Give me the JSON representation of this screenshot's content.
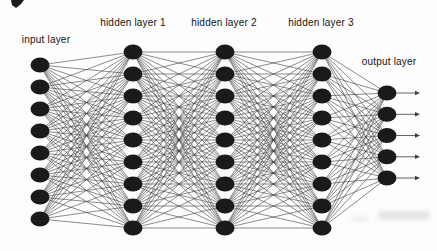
{
  "figure": {
    "background_color": "#fdfdfd",
    "node_color": "#1a1a1a",
    "edge_color": "#3c3c3c",
    "text_color": "#141414",
    "network": {
      "type": "fully-connected-feedforward",
      "node_rx": 9.5,
      "node_ry": 7.5,
      "arrow_end_x": 420,
      "layers": [
        {
          "name": "input",
          "label": "input layer",
          "num_nodes": 8,
          "x": 40,
          "y_start": 65,
          "y_end": 219,
          "label_cx": 46,
          "label_top": 34,
          "output_arrows": false
        },
        {
          "name": "hidden1",
          "label": "hidden layer 1",
          "num_nodes": 9,
          "x": 133,
          "y_start": 52,
          "y_end": 228,
          "label_cx": 133,
          "label_top": 17,
          "output_arrows": false
        },
        {
          "name": "hidden2",
          "label": "hidden layer 2",
          "num_nodes": 9,
          "x": 225,
          "y_start": 52,
          "y_end": 228,
          "label_cx": 224,
          "label_top": 17,
          "output_arrows": false
        },
        {
          "name": "hidden3",
          "label": "hidden layer 3",
          "num_nodes": 9,
          "x": 322,
          "y_start": 52,
          "y_end": 228,
          "label_cx": 321,
          "label_top": 17,
          "output_arrows": false
        },
        {
          "name": "output",
          "label": "output layer",
          "num_nodes": 5,
          "x": 387,
          "y_start": 93,
          "y_end": 178,
          "label_cx": 389,
          "label_top": 56,
          "output_arrows": true
        }
      ]
    }
  }
}
